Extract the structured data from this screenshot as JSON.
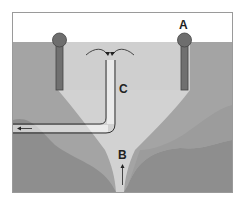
{
  "diagram": {
    "labels": {
      "a": "A",
      "b": "B",
      "c": "C"
    },
    "colors": {
      "frame_border": "#999999",
      "sky": "#ffffff",
      "ground_dark": "#8f8f8f",
      "ground_mid": "#a9a9a9",
      "plume_light": "#d4d4d4",
      "well_fill": "#6f6f6f",
      "line": "#222222"
    },
    "elements": [
      {
        "id": "well-left",
        "kind": "well"
      },
      {
        "id": "well-right",
        "kind": "well",
        "label_ref": "a"
      },
      {
        "id": "extraction-pipe",
        "kind": "pipe",
        "label_ref": "c",
        "flow": "leftward"
      },
      {
        "id": "upflow-channel",
        "kind": "channel",
        "label_ref": "b",
        "flow": "upward"
      }
    ]
  }
}
